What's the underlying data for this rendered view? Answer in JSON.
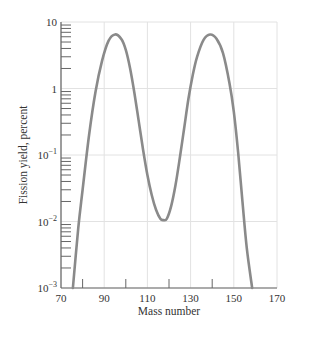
{
  "chart_data": {
    "type": "line",
    "title": "",
    "xlabel": "Mass number",
    "ylabel": "Fission yield, percent",
    "xlim": [
      70,
      170
    ],
    "ylim": [
      0.001,
      10
    ],
    "yscale": "log",
    "grid": true,
    "legend": null,
    "x_ticks": [
      70,
      90,
      110,
      130,
      150,
      170
    ],
    "x_minor_ticks": [
      80,
      100,
      120,
      140
    ],
    "y_ticks": [
      {
        "value": 10,
        "label": "10"
      },
      {
        "value": 1,
        "label": "1"
      },
      {
        "value": 0.1,
        "label": "10",
        "sup": "−1"
      },
      {
        "value": 0.01,
        "label": "10",
        "sup": "−2"
      },
      {
        "value": 0.001,
        "label": "10",
        "sup": "−3"
      }
    ],
    "series": [
      {
        "name": "Fission yield",
        "color": "#8a8a8a",
        "x": [
          75.5,
          78,
          80,
          83,
          86,
          89,
          92,
          95,
          98,
          100,
          102,
          104,
          106,
          108,
          110,
          112,
          114,
          116,
          117.5,
          119,
          121,
          123,
          125,
          127,
          129,
          131,
          133,
          136,
          139,
          142,
          145,
          148,
          150,
          152,
          154,
          156,
          158.5
        ],
        "y": [
          0.001,
          0.008,
          0.03,
          0.2,
          0.9,
          2.6,
          5.2,
          6.5,
          5.5,
          3.8,
          2.0,
          0.85,
          0.32,
          0.12,
          0.05,
          0.025,
          0.015,
          0.011,
          0.0105,
          0.011,
          0.017,
          0.035,
          0.09,
          0.25,
          0.7,
          1.6,
          3.0,
          5.4,
          6.5,
          5.6,
          3.4,
          1.2,
          0.45,
          0.11,
          0.02,
          0.004,
          0.001
        ]
      }
    ]
  },
  "axes": {
    "x_label": "Mass number",
    "y_label": "Fission yield, percent",
    "x_tick_labels": [
      "70",
      "90",
      "110",
      "130",
      "150",
      "170"
    ],
    "y_tick_labels": [
      {
        "base": "10",
        "sup": ""
      },
      {
        "base": "1",
        "sup": ""
      },
      {
        "base": "10",
        "sup": "−1"
      },
      {
        "base": "10",
        "sup": "−2"
      },
      {
        "base": "10",
        "sup": "−3"
      }
    ]
  },
  "style": {
    "curve_color": "#8a8a8a",
    "axis_color": "#666666",
    "grid_color": "#e2e2e2"
  }
}
